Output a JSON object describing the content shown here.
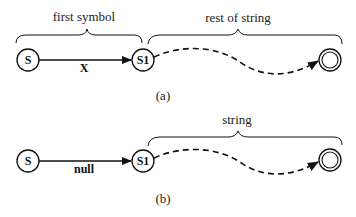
{
  "diagrams": [
    {
      "caption": "(a)",
      "brace_left_label": "first symbol",
      "brace_right_label": "rest of string",
      "start_state": "S",
      "middle_state": "S1",
      "transition_label": "X",
      "final_state": "accepting"
    },
    {
      "caption": "(b)",
      "brace_right_label": "string",
      "start_state": "S",
      "middle_state": "S1",
      "transition_label": "null",
      "final_state": "accepting"
    }
  ],
  "colors": {
    "stroke": "#111111",
    "background": "#ffffff"
  }
}
